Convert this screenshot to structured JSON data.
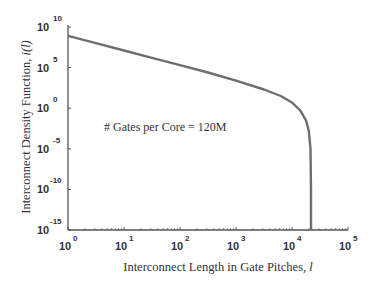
{
  "chart_data": {
    "type": "line",
    "title": "",
    "xlabel": "Interconnect Length in Gate Pitches, l",
    "ylabel": "Interconnect Density Function, i(l)",
    "xscale": "log",
    "yscale": "log",
    "xlim": [
      1,
      100000
    ],
    "ylim": [
      1e-15,
      10000000000.0
    ],
    "x_ticks": [
      {
        "base": "10",
        "exp": "0"
      },
      {
        "base": "10",
        "exp": "1"
      },
      {
        "base": "10",
        "exp": "2"
      },
      {
        "base": "10",
        "exp": "3"
      },
      {
        "base": "10",
        "exp": "4"
      },
      {
        "base": "10",
        "exp": "5"
      }
    ],
    "y_ticks": [
      {
        "base": "10",
        "exp": "10"
      },
      {
        "base": "10",
        "exp": "5"
      },
      {
        "base": "10",
        "exp": "0"
      },
      {
        "base": "10",
        "exp": "-5"
      },
      {
        "base": "10",
        "exp": "-10"
      },
      {
        "base": "10",
        "exp": "-15"
      }
    ],
    "grid": false,
    "legend": null,
    "annotations": [
      "# Gates per Core = 120M"
    ],
    "series": [
      {
        "name": "i(l)",
        "color": "#6e6e6e",
        "log10_x": [
          0,
          0.5,
          1,
          1.5,
          2,
          2.5,
          3,
          3.5,
          3.8,
          4.0,
          4.15,
          4.25,
          4.3,
          4.33,
          4.34,
          4.34
        ],
        "log10_y": [
          8.9,
          8.0,
          7.1,
          6.2,
          5.3,
          4.4,
          3.4,
          2.3,
          1.5,
          0.7,
          -0.3,
          -1.5,
          -2.8,
          -5.0,
          -10.0,
          -15.0
        ]
      }
    ]
  },
  "annotation": {
    "text": "# Gates per Core = 120M"
  },
  "axes": {
    "xlabel_main": "Interconnect Length in Gate Pitches, ",
    "xlabel_var": "l",
    "ylabel_main": "Interconnect Density Function, ",
    "ylabel_var": "i(l)"
  }
}
